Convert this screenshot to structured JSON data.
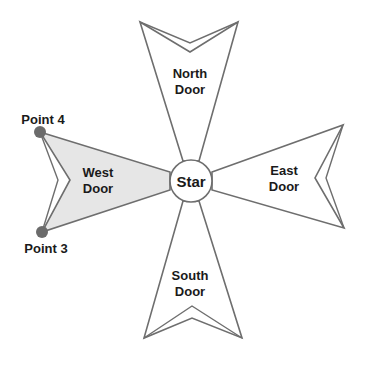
{
  "diagram": {
    "center": {
      "label": "Star"
    },
    "doors": [
      {
        "id": "north",
        "line1": "North",
        "line2": "Door"
      },
      {
        "id": "east",
        "line1": "East",
        "line2": "Door"
      },
      {
        "id": "south",
        "line1": "South",
        "line2": "Door"
      },
      {
        "id": "west",
        "line1": "West",
        "line2": "Door",
        "highlighted": true
      }
    ],
    "points": [
      {
        "label": "Point 4"
      },
      {
        "label": "Point 3"
      }
    ],
    "colors": {
      "stroke": "#6e6e6e",
      "highlight_fill": "#e6e6e6",
      "point_fill": "#6b6b6b",
      "text": "#1a1a1a"
    }
  }
}
